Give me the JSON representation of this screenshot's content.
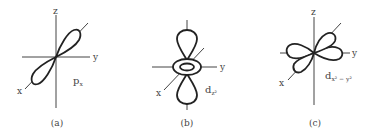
{
  "figure": {
    "panels": [
      {
        "id": "a",
        "caption": "(a)",
        "orbital": {
          "base": "p",
          "subscript": "x"
        },
        "axis_labels": {
          "z": "z",
          "y": "y",
          "x": "x"
        }
      },
      {
        "id": "b",
        "caption": "(b)",
        "orbital": {
          "base": "d",
          "subscript": "z²"
        },
        "axis_labels": {
          "y": "y",
          "x": "x"
        }
      },
      {
        "id": "c",
        "caption": "(c)",
        "orbital": {
          "base": "d",
          "subscript": "x² − y²"
        },
        "axis_labels": {
          "z": "z",
          "y": "y",
          "x": "x"
        }
      }
    ],
    "colors": {
      "line": "#222222",
      "axis": "#444444",
      "background": "#ffffff"
    }
  }
}
